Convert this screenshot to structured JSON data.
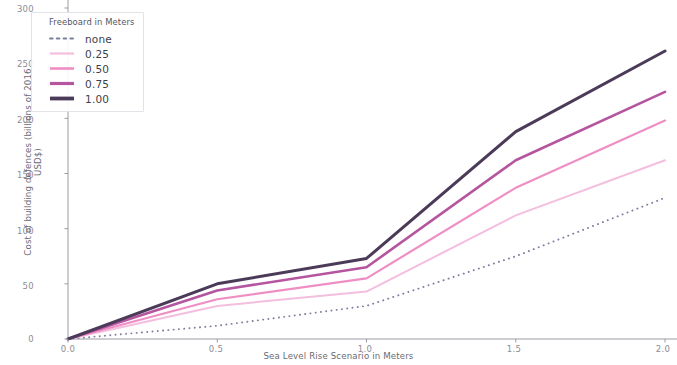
{
  "chart_data": {
    "type": "line",
    "title": "",
    "xlabel": "Sea Level Rise Scenario in Meters",
    "ylabel": "Cost of building defences (billions of 2016 USD$)",
    "xlim": [
      0.0,
      2.0
    ],
    "ylim": [
      0,
      300
    ],
    "xticks": [
      "0.0",
      "0.5",
      "1.0",
      "1.5",
      "2.0"
    ],
    "xtick_values": [
      0.0,
      0.5,
      1.0,
      1.5,
      2.0
    ],
    "yticks": [
      "0",
      "50",
      "100",
      "150",
      "200",
      "250",
      "300"
    ],
    "ytick_values": [
      0,
      50,
      100,
      150,
      200,
      250,
      300
    ],
    "grid": false,
    "legend_position": "upper left",
    "legend_title": "Freeboard in Meters",
    "x": [
      0.0,
      0.5,
      1.0,
      1.5,
      2.0
    ],
    "series": [
      {
        "name": "none",
        "label": "none",
        "color": "#7b7f9e",
        "style": "dotted",
        "width": 1.9,
        "values": [
          0,
          12,
          30,
          75,
          128
        ]
      },
      {
        "name": "0.25",
        "label": "0.25",
        "color": "#f4bede",
        "style": "solid",
        "width": 2.0,
        "values": [
          0,
          30,
          43,
          112,
          162
        ]
      },
      {
        "name": "0.50",
        "label": "0.50",
        "color": "#ef8ec4",
        "style": "solid",
        "width": 2.2,
        "values": [
          0,
          36,
          55,
          137,
          198
        ]
      },
      {
        "name": "0.75",
        "label": "0.75",
        "color": "#b5549f",
        "style": "solid",
        "width": 2.6,
        "values": [
          0,
          44,
          65,
          162,
          224
        ]
      },
      {
        "name": "1.00",
        "label": "1.00",
        "color": "#4b3b58",
        "style": "solid",
        "width": 3.0,
        "values": [
          0,
          50,
          73,
          188,
          261
        ]
      }
    ]
  }
}
